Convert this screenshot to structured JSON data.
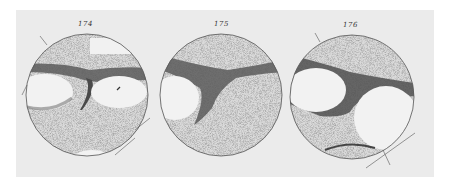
{
  "plate": {
    "description": "Engraved plate of three circular telescopic drawings of a planetary disk with dark bands and light patches",
    "background_color": "#ebebeb",
    "ink_color": "#3a3a3a",
    "stipple_color": "#c9c9c9"
  },
  "figures": [
    {
      "number": "174",
      "letters": [
        "D",
        "D",
        "a",
        "b",
        "f",
        "g",
        "k",
        "D",
        "e",
        "d"
      ]
    },
    {
      "number": "175",
      "letters": [
        "a",
        "b",
        "D",
        "r"
      ]
    },
    {
      "number": "176",
      "letters": [
        "D",
        "a",
        "b",
        "i",
        "c",
        "r",
        "l",
        "D"
      ]
    }
  ]
}
